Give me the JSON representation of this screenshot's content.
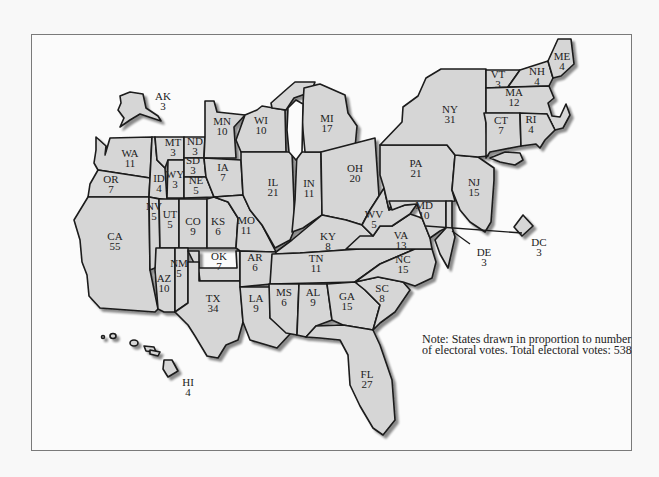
{
  "figure": {
    "type": "cartogram",
    "note": "Note: States drawn in proportion to number of electoral votes.  Total electoral votes: 538",
    "total_electoral_votes": 538,
    "colors": {
      "fill": "#d6d6d6",
      "outline": "#1a1a1a",
      "shadow": "#9a9a9a",
      "background": "#fbfbfb",
      "frame": "#7a7a7a"
    }
  },
  "states": [
    {
      "abbr": "AK",
      "votes": "3",
      "x": 163,
      "y": 100
    },
    {
      "abbr": "HI",
      "votes": "4",
      "x": 188,
      "y": 386
    },
    {
      "abbr": "WA",
      "votes": "11",
      "x": 130,
      "y": 157
    },
    {
      "abbr": "OR",
      "votes": "7",
      "x": 111,
      "y": 183
    },
    {
      "abbr": "CA",
      "votes": "55",
      "x": 115,
      "y": 240
    },
    {
      "abbr": "ID",
      "votes": "4",
      "x": 159,
      "y": 182
    },
    {
      "abbr": "NV",
      "votes": "5",
      "x": 154,
      "y": 210
    },
    {
      "abbr": "MT",
      "votes": "3",
      "x": 173,
      "y": 146
    },
    {
      "abbr": "WY",
      "votes": "3",
      "x": 175,
      "y": 178
    },
    {
      "abbr": "UT",
      "votes": "5",
      "x": 170,
      "y": 218
    },
    {
      "abbr": "AZ",
      "votes": "10",
      "x": 164,
      "y": 282
    },
    {
      "abbr": "ND",
      "votes": "3",
      "x": 195,
      "y": 145
    },
    {
      "abbr": "SD",
      "votes": "3",
      "x": 193,
      "y": 164
    },
    {
      "abbr": "NE",
      "votes": "5",
      "x": 196,
      "y": 184
    },
    {
      "abbr": "CO",
      "votes": "9",
      "x": 193,
      "y": 225
    },
    {
      "abbr": "NM",
      "votes": "5",
      "x": 179,
      "y": 267
    },
    {
      "abbr": "KS",
      "votes": "6",
      "x": 218,
      "y": 225
    },
    {
      "abbr": "OK",
      "votes": "7",
      "x": 219,
      "y": 260
    },
    {
      "abbr": "TX",
      "votes": "34",
      "x": 213,
      "y": 302
    },
    {
      "abbr": "MN",
      "votes": "10",
      "x": 222,
      "y": 125
    },
    {
      "abbr": "IA",
      "votes": "7",
      "x": 223,
      "y": 171
    },
    {
      "abbr": "MO",
      "votes": "11",
      "x": 246,
      "y": 224
    },
    {
      "abbr": "AR",
      "votes": "6",
      "x": 255,
      "y": 261
    },
    {
      "abbr": "LA",
      "votes": "9",
      "x": 256,
      "y": 302
    },
    {
      "abbr": "WI",
      "votes": "10",
      "x": 261,
      "y": 124
    },
    {
      "abbr": "IL",
      "votes": "21",
      "x": 273,
      "y": 186
    },
    {
      "abbr": "MI",
      "votes": "17",
      "x": 327,
      "y": 122
    },
    {
      "abbr": "IN",
      "votes": "11",
      "x": 309,
      "y": 187
    },
    {
      "abbr": "OH",
      "votes": "20",
      "x": 355,
      "y": 172
    },
    {
      "abbr": "KY",
      "votes": "8",
      "x": 328,
      "y": 240
    },
    {
      "abbr": "TN",
      "votes": "11",
      "x": 316,
      "y": 262
    },
    {
      "abbr": "MS",
      "votes": "6",
      "x": 284,
      "y": 296
    },
    {
      "abbr": "AL",
      "votes": "9",
      "x": 313,
      "y": 296
    },
    {
      "abbr": "GA",
      "votes": "15",
      "x": 347,
      "y": 300
    },
    {
      "abbr": "FL",
      "votes": "27",
      "x": 367,
      "y": 378
    },
    {
      "abbr": "SC",
      "votes": "8",
      "x": 382,
      "y": 292
    },
    {
      "abbr": "NC",
      "votes": "15",
      "x": 403,
      "y": 263
    },
    {
      "abbr": "VA",
      "votes": "13",
      "x": 401,
      "y": 239
    },
    {
      "abbr": "WV",
      "votes": "5",
      "x": 374,
      "y": 218
    },
    {
      "abbr": "PA",
      "votes": "21",
      "x": 416,
      "y": 167
    },
    {
      "abbr": "NY",
      "votes": "31",
      "x": 450,
      "y": 113
    },
    {
      "abbr": "NJ",
      "votes": "15",
      "x": 474,
      "y": 186
    },
    {
      "abbr": "MD",
      "votes": "10",
      "x": 424,
      "y": 209
    },
    {
      "abbr": "DE",
      "votes": "3",
      "x": 484,
      "y": 256
    },
    {
      "abbr": "DC",
      "votes": "3",
      "x": 539,
      "y": 246
    },
    {
      "abbr": "VT",
      "votes": "3",
      "x": 498,
      "y": 78
    },
    {
      "abbr": "NH",
      "votes": "4",
      "x": 537,
      "y": 75
    },
    {
      "abbr": "ME",
      "votes": "4",
      "x": 562,
      "y": 60
    },
    {
      "abbr": "MA",
      "votes": "12",
      "x": 514,
      "y": 96
    },
    {
      "abbr": "CT",
      "votes": "7",
      "x": 501,
      "y": 124
    },
    {
      "abbr": "RI",
      "votes": "4",
      "x": 531,
      "y": 123
    }
  ]
}
